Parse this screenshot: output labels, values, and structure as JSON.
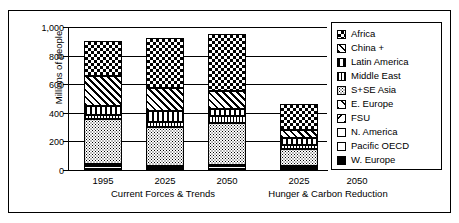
{
  "chart_data": {
    "type": "bar",
    "subtype": "stacked-bar",
    "title": "",
    "xlabel": "",
    "ylabel": "Millions of people",
    "ylim": [
      0,
      1000
    ],
    "yticks": [
      0,
      200,
      400,
      600,
      800,
      1000
    ],
    "ytick_labels": [
      "0",
      "200",
      "400",
      "600",
      "800",
      "1,000"
    ],
    "grid": "horizontal",
    "legend_position": "right",
    "categories": [
      "1995",
      "2025",
      "2050",
      "2025",
      "2050"
    ],
    "groups": [
      {
        "label": "Current Forces & Trends",
        "categories": [
          "1995",
          "2025",
          "2050"
        ]
      },
      {
        "label": "Hunger & Carbon Reduction",
        "categories": [
          "2025",
          "2050"
        ]
      }
    ],
    "series": [
      {
        "name": "W. Europe",
        "pattern": "solid-black",
        "values": [
          3,
          3,
          3,
          3,
          3
        ]
      },
      {
        "name": "Pacific OECD",
        "pattern": "white",
        "values": [
          7,
          5,
          5,
          5,
          4
        ]
      },
      {
        "name": "N. America",
        "pattern": "white",
        "values": [
          20,
          10,
          18,
          10,
          10
        ]
      },
      {
        "name": "FSU",
        "pattern": "diag-light-back",
        "values": [
          5,
          5,
          5,
          5,
          5
        ]
      },
      {
        "name": "E. Europe",
        "pattern": "diag-light-fwd",
        "values": [
          5,
          5,
          5,
          5,
          4
        ]
      },
      {
        "name": "S+SE Asia",
        "pattern": "dense-dots",
        "values": [
          320,
          270,
          295,
          120,
          80
        ]
      },
      {
        "name": "Middle East",
        "pattern": "narrow-vertical",
        "values": [
          25,
          40,
          45,
          30,
          20
        ]
      },
      {
        "name": "Latin America",
        "pattern": "wide-vertical",
        "values": [
          65,
          75,
          50,
          45,
          25
        ]
      },
      {
        "name": "China +",
        "pattern": "diagonal-hatch",
        "values": [
          205,
          160,
          125,
          60,
          35
        ]
      },
      {
        "name": "Africa",
        "pattern": "checkerboard",
        "values": [
          245,
          347,
          399,
          177,
          40
        ]
      }
    ],
    "totals": [
      900,
      920,
      950,
      455,
      225
    ],
    "legend_entries": [
      "Africa",
      "China +",
      "Latin America",
      "Middle East",
      "S+SE Asia",
      "E. Europe",
      "FSU",
      "N. America",
      "Pacific OECD",
      "W. Europe"
    ]
  }
}
